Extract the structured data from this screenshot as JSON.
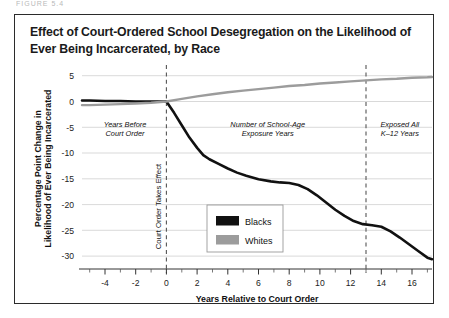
{
  "figure": {
    "title": "Effect of Court-Ordered School Desegregation on the Likelihood of Ever Being Incarcerated, by Race",
    "cut_off_header": "FIGURE 5.4"
  },
  "chart_data": {
    "type": "line",
    "title": "Effect of Court-Ordered School Desegregation on the Likelihood of Ever Being Incarcerated, by Race",
    "xlabel": "Years Relative to Court Order",
    "ylabel": "Percentage Point Change in Likelihood of Ever Being Incarcerated",
    "xlim": [
      -5.5,
      17.3
    ],
    "ylim": [
      -32.5,
      6.5
    ],
    "xticks": [
      -4,
      -2,
      0,
      2,
      4,
      6,
      8,
      10,
      12,
      14,
      16
    ],
    "xtick_labels": [
      "-4",
      "-2",
      "0",
      "2",
      "4",
      "6",
      "8",
      "10",
      "12",
      "14",
      "16"
    ],
    "xminor_ticks": [
      -5,
      -3,
      -1,
      1,
      3,
      5,
      7,
      9,
      11,
      13,
      15,
      17
    ],
    "yticks": [
      5,
      0,
      -5,
      -10,
      -15,
      -20,
      -25,
      -30
    ],
    "ytick_labels": [
      "5",
      "0",
      "-5",
      "-10",
      "-15",
      "-20",
      "-25",
      "-30"
    ],
    "grid": "horizontal",
    "legend_position": "center",
    "series": [
      {
        "name": "Blacks",
        "color": "#111111",
        "width": 2.6,
        "points": [
          [
            -5.5,
            0.2
          ],
          [
            -5.0,
            0.2
          ],
          [
            -4.0,
            0.1
          ],
          [
            -3.0,
            0.1
          ],
          [
            -2.0,
            0.0
          ],
          [
            -1.0,
            0.0
          ],
          [
            -0.3,
            0.0
          ],
          [
            0.0,
            0.0
          ],
          [
            0.5,
            -2.2
          ],
          [
            1.0,
            -4.6
          ],
          [
            1.5,
            -7.0
          ],
          [
            2.0,
            -9.0
          ],
          [
            2.4,
            -10.4
          ],
          [
            2.8,
            -11.2
          ],
          [
            3.4,
            -12.1
          ],
          [
            4.0,
            -13.0
          ],
          [
            4.6,
            -13.8
          ],
          [
            5.2,
            -14.4
          ],
          [
            6.0,
            -15.1
          ],
          [
            6.8,
            -15.5
          ],
          [
            7.4,
            -15.7
          ],
          [
            8.0,
            -15.8
          ],
          [
            8.6,
            -16.2
          ],
          [
            9.2,
            -17.0
          ],
          [
            9.8,
            -18.2
          ],
          [
            10.4,
            -19.6
          ],
          [
            11.0,
            -21.0
          ],
          [
            11.6,
            -22.2
          ],
          [
            12.2,
            -23.2
          ],
          [
            12.8,
            -23.8
          ],
          [
            13.4,
            -24.0
          ],
          [
            14.0,
            -24.3
          ],
          [
            14.6,
            -25.2
          ],
          [
            15.2,
            -26.4
          ],
          [
            15.8,
            -27.7
          ],
          [
            16.4,
            -29.0
          ],
          [
            17.0,
            -30.3
          ],
          [
            17.3,
            -30.6
          ]
        ]
      },
      {
        "name": "Whites",
        "color": "#9c9c9c",
        "width": 2.4,
        "points": [
          [
            -5.5,
            -0.7
          ],
          [
            -5.0,
            -0.7
          ],
          [
            -4.0,
            -0.6
          ],
          [
            -3.0,
            -0.5
          ],
          [
            -2.0,
            -0.4
          ],
          [
            -1.0,
            -0.25
          ],
          [
            0.0,
            0.0
          ],
          [
            1.0,
            0.5
          ],
          [
            2.0,
            1.0
          ],
          [
            3.0,
            1.4
          ],
          [
            4.0,
            1.8
          ],
          [
            5.0,
            2.1
          ],
          [
            6.0,
            2.4
          ],
          [
            7.0,
            2.7
          ],
          [
            8.0,
            3.0
          ],
          [
            9.0,
            3.2
          ],
          [
            10.0,
            3.5
          ],
          [
            11.0,
            3.7
          ],
          [
            12.0,
            3.9
          ],
          [
            13.0,
            4.1
          ],
          [
            14.0,
            4.3
          ],
          [
            15.0,
            4.4
          ],
          [
            16.0,
            4.6
          ],
          [
            17.0,
            4.7
          ],
          [
            17.3,
            4.75
          ]
        ]
      }
    ],
    "vlines": [
      {
        "x": 0,
        "style": "dashed",
        "label": "Court Order Takes Effect",
        "orientation": "vertical-text"
      },
      {
        "x": 13,
        "style": "dashed",
        "label": ""
      }
    ],
    "annotations": [
      {
        "text_lines": [
          "Years Before",
          "Court Order"
        ],
        "x": -2.7,
        "y": -5.0
      },
      {
        "text_lines": [
          "Number of School-Age",
          "Exposure Years"
        ],
        "x": 6.6,
        "y": -5.0
      },
      {
        "text_lines": [
          "Exposed All",
          "K–12 Years"
        ],
        "x": 15.2,
        "y": -5.0
      }
    ],
    "legend": [
      {
        "label": "Blacks",
        "color": "#111111"
      },
      {
        "label": "Whites",
        "color": "#9c9c9c"
      }
    ]
  }
}
